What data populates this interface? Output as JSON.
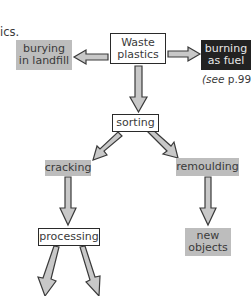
{
  "fragment": {
    "text": "ics."
  },
  "nodes": {
    "waste": {
      "line1": "Waste",
      "line2": "plastics",
      "style": "outlined"
    },
    "bury": {
      "line1": "burying",
      "line2": "in landfill",
      "style": "grey"
    },
    "burn": {
      "line1": "burning",
      "line2": "as fuel",
      "style": "black",
      "note_prefix": "(",
      "note_italic": "see",
      "note_suffix": " p.99)"
    },
    "sorting": {
      "label": "sorting",
      "style": "outlined"
    },
    "cracking": {
      "label": "cracking",
      "style": "grey"
    },
    "remoulding": {
      "label": "remoulding",
      "style": "grey"
    },
    "processing": {
      "label": "processing",
      "style": "outlined"
    },
    "newobjects": {
      "line1": "new",
      "line2": "objects",
      "style": "grey"
    }
  },
  "edges": [
    {
      "from": "waste",
      "to": "bury"
    },
    {
      "from": "waste",
      "to": "burn"
    },
    {
      "from": "waste",
      "to": "sorting"
    },
    {
      "from": "sorting",
      "to": "cracking"
    },
    {
      "from": "sorting",
      "to": "remoulding"
    },
    {
      "from": "cracking",
      "to": "processing"
    },
    {
      "from": "remoulding",
      "to": "newobjects"
    },
    {
      "from": "processing",
      "to": "offscreen-left"
    },
    {
      "from": "processing",
      "to": "offscreen-right"
    }
  ],
  "colors": {
    "grey_box": "#bdbdbd",
    "black_box": "#222222",
    "arrow_fill": "#c8c8c8",
    "arrow_stroke": "#3a3a3a"
  }
}
